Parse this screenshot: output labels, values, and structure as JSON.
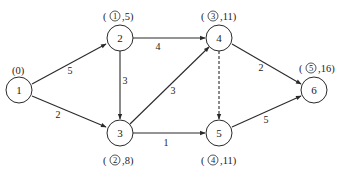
{
  "diagram": {
    "type": "directed-network-shortest-path",
    "nodes": [
      {
        "id": "1",
        "label": "1",
        "annotation": "(0)"
      },
      {
        "id": "2",
        "label": "2",
        "annotation_order": "1",
        "annotation_value": ",5)"
      },
      {
        "id": "3",
        "label": "3",
        "annotation_order": "2",
        "annotation_value": ",8)"
      },
      {
        "id": "4",
        "label": "4",
        "annotation_order": "3",
        "annotation_value": ",11)"
      },
      {
        "id": "5",
        "label": "5",
        "annotation_order": "4",
        "annotation_value": ",11)"
      },
      {
        "id": "6",
        "label": "6",
        "annotation_order": "5",
        "annotation_value": ",16)"
      }
    ],
    "edges": [
      {
        "from": "1",
        "to": "2",
        "weight": "5",
        "style": "solid"
      },
      {
        "from": "1",
        "to": "3",
        "weight": "2",
        "style": "solid"
      },
      {
        "from": "2",
        "to": "4",
        "weight": "4",
        "style": "solid"
      },
      {
        "from": "2",
        "to": "3",
        "weight": "3",
        "style": "solid"
      },
      {
        "from": "3",
        "to": "4",
        "weight": "3",
        "style": "solid"
      },
      {
        "from": "3",
        "to": "5",
        "weight": "1",
        "style": "solid"
      },
      {
        "from": "4",
        "to": "5",
        "weight": "",
        "style": "dashed"
      },
      {
        "from": "4",
        "to": "6",
        "weight": "2",
        "style": "solid"
      },
      {
        "from": "5",
        "to": "6",
        "weight": "5",
        "style": "solid"
      }
    ],
    "open_paren": "("
  }
}
